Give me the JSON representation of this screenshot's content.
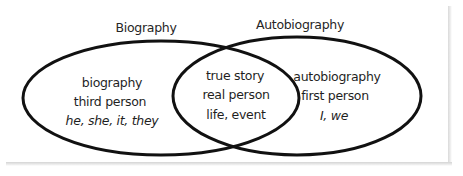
{
  "diagram": {
    "type": "venn",
    "line_color": "#111111",
    "text_color": "#1f1f1f",
    "sets": [
      {
        "title": "Biography",
        "items": [
          "biography",
          "third person",
          "he, she, it, they"
        ],
        "italic_items": [
          false,
          false,
          true
        ]
      },
      {
        "title": "Autobiography",
        "items": [
          "autobiography",
          "first person",
          "I, we"
        ],
        "italic_items": [
          false,
          false,
          true
        ]
      }
    ],
    "overlap": {
      "items": [
        "true story",
        "real person",
        "life, event"
      ],
      "italic_items": [
        false,
        false,
        false
      ]
    }
  }
}
